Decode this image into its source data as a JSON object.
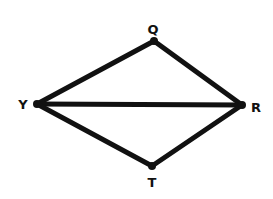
{
  "diagram": {
    "type": "geometry",
    "points": {
      "Q": {
        "label": "Q",
        "x": 154,
        "y": 41,
        "lx": 153,
        "ly": 34
      },
      "Y": {
        "label": "Y",
        "x": 37,
        "y": 104,
        "lx": 23,
        "ly": 109
      },
      "R": {
        "label": "R",
        "x": 242,
        "y": 105,
        "lx": 256,
        "ly": 112
      },
      "T": {
        "label": "T",
        "x": 152,
        "y": 166,
        "lx": 152,
        "ly": 187
      }
    },
    "segments": [
      {
        "from": "Y",
        "to": "Q"
      },
      {
        "from": "Q",
        "to": "R"
      },
      {
        "from": "Y",
        "to": "R"
      },
      {
        "from": "Y",
        "to": "T"
      },
      {
        "from": "T",
        "to": "R"
      }
    ],
    "colors": {
      "line": "#111111",
      "background": "#ffffff"
    }
  }
}
